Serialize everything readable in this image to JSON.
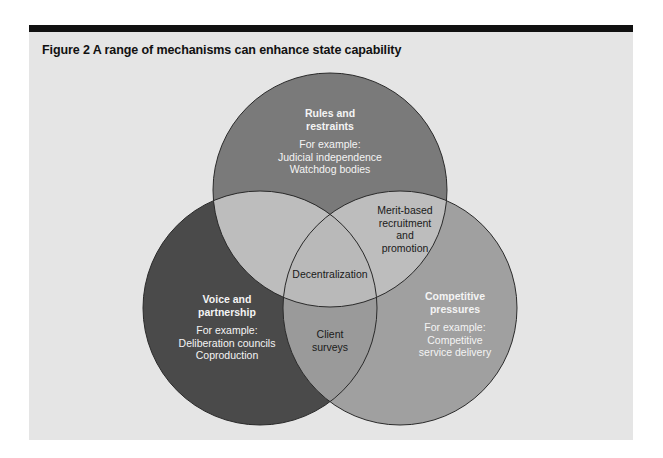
{
  "figure": {
    "title": "Figure 2  A range of mechanisms can enhance state capability"
  },
  "colors": {
    "top_bar": "#111111",
    "panel_bg": "#e5e5e5",
    "rules_circle": "#7a7a7a",
    "voice_circle": "#4a4a4a",
    "competitive_circle": "#a0a0a0",
    "overlap_rules_voice": "#bdbdbd",
    "overlap_rules_competitive": "#bdbdbd",
    "overlap_center": "#b9b9b9",
    "overlap_voice_competitive": "#9a9a9a"
  },
  "circles": {
    "rules": {
      "heading_line1": "Rules and",
      "heading_line2": "restraints",
      "example_label": "For example:",
      "examples": [
        "Judicial independence",
        "Watchdog bodies"
      ]
    },
    "voice": {
      "heading_line1": "Voice and",
      "heading_line2": "partnership",
      "example_label": "For example:",
      "examples": [
        "Deliberation councils",
        "Coproduction"
      ]
    },
    "competitive": {
      "heading_line1": "Competitive",
      "heading_line2": "pressures",
      "example_label": "For example:",
      "examples": [
        "Competitive",
        "service delivery"
      ]
    }
  },
  "overlaps": {
    "rules_competitive": [
      "Merit-based",
      "recruitment",
      "and",
      "promotion"
    ],
    "center": "Decentralization",
    "voice_competitive": [
      "Client",
      "surveys"
    ]
  }
}
